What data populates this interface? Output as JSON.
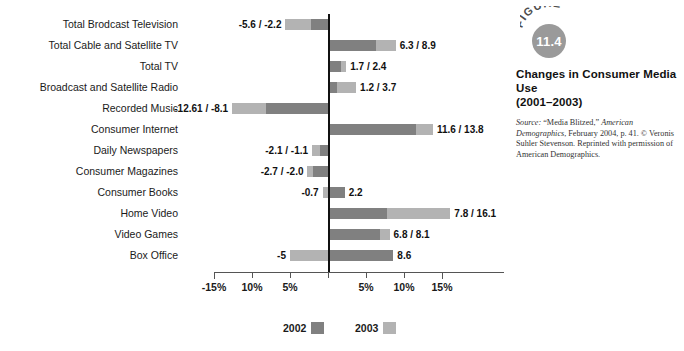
{
  "chart_data": {
    "type": "bar",
    "orientation": "horizontal",
    "title": "Changes in Consumer Media Use (2001–2003)",
    "xlabel": "",
    "ylabel": "",
    "xlim": [
      -16.5,
      16.5
    ],
    "grid": false,
    "legend_position": "bottom",
    "zero_line": true,
    "categories": [
      "Total Brodcast Television",
      "Total Cable and Satellite TV",
      "Total TV",
      "Broadcast and Satellite Radio",
      "Recorded Music",
      "Consumer Internet",
      "Daily Newspapers",
      "Consumer Magazines",
      "Consumer Books",
      "Home Video",
      "Video Games",
      "Box Office"
    ],
    "series": [
      {
        "name": "2002",
        "color": "#808080",
        "values": [
          -2.2,
          6.3,
          1.7,
          1.2,
          -8.1,
          11.6,
          -1.1,
          -2.0,
          2.2,
          7.8,
          6.8,
          8.6
        ]
      },
      {
        "name": "2003",
        "color": "#b3b3b3",
        "values": [
          -5.6,
          8.9,
          2.4,
          3.7,
          -12.61,
          13.8,
          -2.1,
          -2.7,
          -0.7,
          16.1,
          8.1,
          -5.0
        ]
      }
    ],
    "data_labels": [
      "-5.6 / -2.2",
      "6.3 / 8.9",
      "1.7 / 2.4",
      "1.2 / 3.7",
      "-12.61 / -8.1",
      "11.6 / 13.8",
      "-2.1 / -1.1",
      "-2.7 / -2.0",
      "-0.7",
      "7.8 / 16.1",
      "6.8 / 8.1",
      "-5"
    ],
    "extra_data_labels": {
      "Consumer Books": "2.2",
      "Box Office": "8.6"
    },
    "xticks": [
      -15,
      -10,
      -5,
      0,
      5,
      10,
      15
    ],
    "xticklabels": [
      "-15%",
      "10%",
      "5%",
      "",
      "5%",
      "10%",
      "15%"
    ]
  },
  "rows": [
    {
      "label": "Total Brodcast Television",
      "v2002": -2.2,
      "v2003": -5.6,
      "label_left": "-5.6 / -2.2",
      "label_right": ""
    },
    {
      "label": "Total Cable and Satellite TV",
      "v2002": 6.3,
      "v2003": 8.9,
      "label_left": "",
      "label_right": "6.3 / 8.9"
    },
    {
      "label": "Total TV",
      "v2002": 1.7,
      "v2003": 2.4,
      "label_left": "",
      "label_right": "1.7 / 2.4"
    },
    {
      "label": "Broadcast and Satellite Radio",
      "v2002": 1.2,
      "v2003": 3.7,
      "label_left": "",
      "label_right": "1.2 / 3.7"
    },
    {
      "label": "Recorded Music",
      "v2002": -8.1,
      "v2003": -12.61,
      "label_left": "-12.61 / -8.1",
      "label_right": ""
    },
    {
      "label": "Consumer Internet",
      "v2002": 11.6,
      "v2003": 13.8,
      "label_left": "",
      "label_right": "11.6 / 13.8"
    },
    {
      "label": "Daily Newspapers",
      "v2002": -1.1,
      "v2003": -2.1,
      "label_left": "-2.1 / -1.1",
      "label_right": ""
    },
    {
      "label": "Consumer Magazines",
      "v2002": -2.0,
      "v2003": -2.7,
      "label_left": "-2.7 / -2.0",
      "label_right": ""
    },
    {
      "label": "Consumer Books",
      "v2002": 2.2,
      "v2003": -0.7,
      "label_left": "-0.7",
      "label_right": "2.2"
    },
    {
      "label": "Home Video",
      "v2002": 7.8,
      "v2003": 16.1,
      "label_left": "",
      "label_right": "7.8 / 16.1"
    },
    {
      "label": "Video Games",
      "v2002": 6.8,
      "v2003": 8.1,
      "label_left": "",
      "label_right": "6.8 / 8.1"
    },
    {
      "label": "Box Office",
      "v2002": 8.6,
      "v2003": -5.0,
      "label_left": "-5",
      "label_right": "8.6"
    }
  ],
  "axis": {
    "ticks": [
      {
        "value": -15,
        "label": "-15%"
      },
      {
        "value": -10,
        "label": "10%"
      },
      {
        "value": -5,
        "label": "5%"
      },
      {
        "value": 0,
        "label": ""
      },
      {
        "value": 5,
        "label": "5%"
      },
      {
        "value": 10,
        "label": "10%"
      },
      {
        "value": 15,
        "label": "15%"
      }
    ]
  },
  "legend": {
    "items": [
      {
        "label": "2002",
        "color": "#808080"
      },
      {
        "label": "2003",
        "color": "#b3b3b3"
      }
    ]
  },
  "figure": {
    "word": "FIGURE",
    "number": "11.4",
    "title_line1": "Changes in Consumer Media Use",
    "title_line2": "(2001–2003)",
    "source_prefix": "Source:",
    "source_text_1": " “Media Blitzed,” ",
    "source_italic_1": "American Demographics",
    "source_text_2": ", February 2004, p. 41. © Veronis Suhler Stevenson. Reprinted with permission of American Demographics."
  }
}
